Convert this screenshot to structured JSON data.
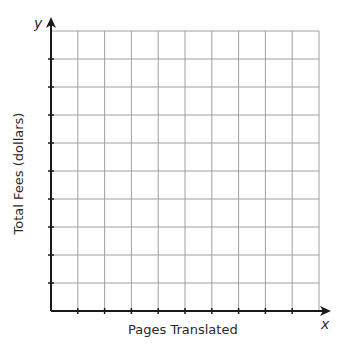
{
  "chart_data": {
    "type": "line",
    "title": "",
    "xlabel": "Pages Translated",
    "ylabel": "Total Fees (dollars)",
    "x_axis_variable": "x",
    "y_axis_variable": "y",
    "grid": true,
    "grid_columns": 10,
    "grid_rows": 10,
    "x_tick_labels": [],
    "y_tick_labels": [],
    "series": []
  },
  "colors": {
    "axis": "#1a1a1a",
    "grid": "#a0a0a0",
    "text": "#2a2a2a"
  }
}
